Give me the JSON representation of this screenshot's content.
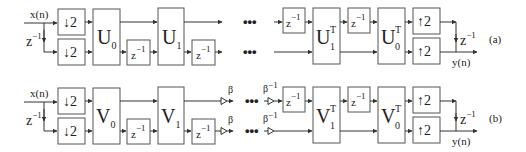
{
  "diagram": {
    "type": "multirate filter bank block diagram",
    "panels": [
      {
        "id": "a",
        "label": "(a)",
        "input_label": "x(n)",
        "output_label": "y(n)",
        "delay_label": "z",
        "delay_exp": "−1",
        "down_label": "2",
        "up_label": "2",
        "analysis_blocks": [
          {
            "base": "U",
            "sub": "0"
          },
          {
            "base": "U",
            "sub": "1"
          }
        ],
        "synthesis_blocks": [
          {
            "base": "U",
            "sub": "1",
            "sup": "T"
          },
          {
            "base": "U",
            "sub": "0",
            "sup": "T"
          }
        ],
        "ellipsis": "•••"
      },
      {
        "id": "b",
        "label": "(b)",
        "input_label": "x(n)",
        "output_label": "y(n)",
        "delay_label": "z",
        "delay_exp": "−1",
        "down_label": "2",
        "up_label": "2",
        "scale_label": "β",
        "inv_scale_label": "β",
        "inv_scale_exp": "−1",
        "analysis_blocks": [
          {
            "base": "V",
            "sub": "0"
          },
          {
            "base": "V",
            "sub": "1"
          }
        ],
        "synthesis_blocks": [
          {
            "base": "V",
            "sub": "1",
            "sup": "T"
          },
          {
            "base": "V",
            "sub": "0",
            "sup": "T"
          }
        ],
        "ellipsis": "•••"
      }
    ]
  }
}
